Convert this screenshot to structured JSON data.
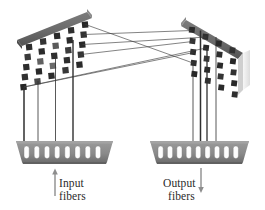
{
  "figure": {
    "background_color": "#ffffff"
  },
  "colors": {
    "frame_top_dark": "#6e6e6e",
    "frame_top_shadow": "#575757",
    "mirror_dark": "#2a2a2a",
    "mirror_mid": "#4f4f4f",
    "mirror_light": "#8a8a8a",
    "panel_face": "#f2f2f2",
    "panel_edge_light": "#e2e2e2",
    "block_body": "#8d8d8d",
    "block_body_dark": "#6b6b6b",
    "slot_white": "#fdfdfd",
    "line_color": "#3a3a3a",
    "text_color": "#2b2b2b",
    "arrow_color": "#8a8a8a"
  },
  "left_array": {
    "name": "input-mirror-array",
    "rows": 5,
    "cols": 5,
    "mirror_count": 25,
    "tilt_label": "tilted-left"
  },
  "right_array": {
    "name": "output-mirror-array",
    "rows": 5,
    "cols": 4,
    "mirror_count": 20,
    "tilt_label": "tilted-right"
  },
  "input_block": {
    "name": "input-fiber-block",
    "slot_count": 9,
    "fiber_line_count": 4
  },
  "output_block": {
    "name": "output-fiber-block",
    "slot_count": 10,
    "fiber_line_count": 4
  },
  "labels": {
    "input": {
      "line1": "Input",
      "line2": "fibers",
      "arrow": "up-arrow"
    },
    "output": {
      "line1": "Output",
      "line2": "fibers",
      "arrow": "down-arrow"
    }
  },
  "beams": {
    "count": 5,
    "description": "crossing optical beam paths between mirror arrays"
  }
}
